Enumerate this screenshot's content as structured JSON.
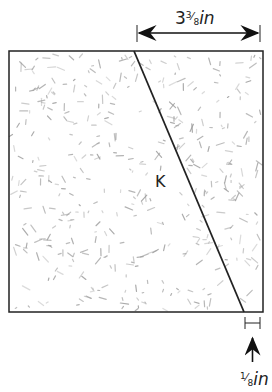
{
  "diagram": {
    "region_label": "K",
    "top_dimension": {
      "whole": "3",
      "numerator": "3",
      "denominator": "8",
      "unit": "in"
    },
    "bottom_dimension": {
      "numerator": "1",
      "denominator": "8",
      "unit": "in"
    },
    "colors": {
      "outline": "#222222",
      "texture": "#9a9a9a",
      "background": "#ffffff"
    }
  }
}
